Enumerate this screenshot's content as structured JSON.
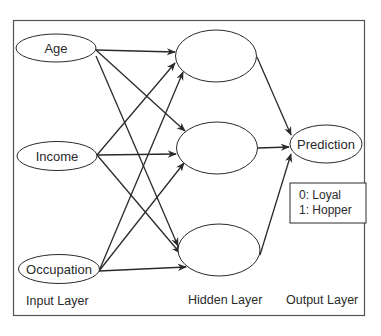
{
  "diagram": {
    "nodes": {
      "input": [
        {
          "id": "age",
          "label": "Age"
        },
        {
          "id": "income",
          "label": "Income"
        },
        {
          "id": "occupation",
          "label": "Occupation"
        }
      ],
      "hidden": [
        {
          "id": "h1",
          "label": ""
        },
        {
          "id": "h2",
          "label": ""
        },
        {
          "id": "h3",
          "label": ""
        }
      ],
      "output": [
        {
          "id": "prediction",
          "label": "Prediction"
        }
      ]
    },
    "edges": [
      [
        "age",
        "h1"
      ],
      [
        "age",
        "h2"
      ],
      [
        "age",
        "h3"
      ],
      [
        "income",
        "h1"
      ],
      [
        "income",
        "h2"
      ],
      [
        "income",
        "h3"
      ],
      [
        "occupation",
        "h1"
      ],
      [
        "occupation",
        "h2"
      ],
      [
        "occupation",
        "h3"
      ],
      [
        "h1",
        "prediction"
      ],
      [
        "h2",
        "prediction"
      ],
      [
        "h3",
        "prediction"
      ]
    ],
    "legend": {
      "line1": "0: Loyal",
      "line2": "1: Hopper"
    },
    "layer_labels": {
      "input": "Input Layer",
      "hidden": "Hidden Layer",
      "output": "Output Layer"
    },
    "colors": {
      "stroke": "#2a2a2a",
      "frame": "#555555",
      "background": "#ffffff"
    }
  }
}
